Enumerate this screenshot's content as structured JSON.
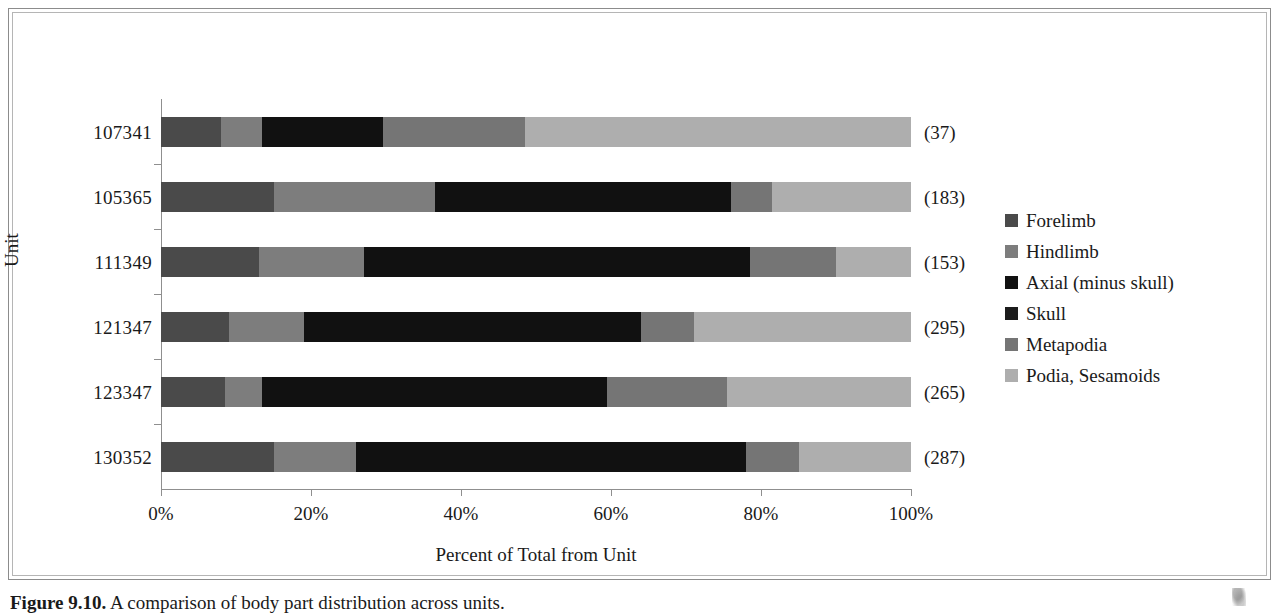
{
  "figure": {
    "caption_label": "Figure 9.10.",
    "caption_text": "A comparison of body part distribution across units."
  },
  "chart_data": {
    "type": "bar",
    "orientation": "horizontal",
    "stacked": true,
    "normalized_percent": true,
    "title": "",
    "xlabel": "Percent of Total from Unit",
    "ylabel": "Unit",
    "xlim": [
      0,
      100
    ],
    "xticks": [
      0,
      20,
      40,
      60,
      80,
      100
    ],
    "xtick_labels": [
      "0%",
      "20%",
      "40%",
      "60%",
      "80%",
      "100%"
    ],
    "grid": false,
    "legend_position": "right",
    "categories": [
      "107341",
      "105365",
      "111349",
      "121347",
      "123347",
      "130352"
    ],
    "category_totals": [
      "(37)",
      "(183)",
      "(153)",
      "(295)",
      "(265)",
      "(287)"
    ],
    "series": [
      {
        "name": "Forelimb",
        "color": "#4a4a4a",
        "values": [
          8.0,
          15.0,
          13.0,
          9.0,
          8.5,
          15.0
        ]
      },
      {
        "name": "Hindlimb",
        "color": "#7d7d7d",
        "values": [
          5.5,
          21.5,
          14.0,
          10.0,
          5.0,
          11.0
        ]
      },
      {
        "name": "Axial (minus skull)",
        "color": "#111111",
        "values": [
          16.1,
          39.5,
          51.5,
          45.0,
          46.0,
          52.0
        ]
      },
      {
        "name": "Skull",
        "color": "#1c1c1c",
        "values": [
          0.0,
          0.0,
          0.0,
          0.0,
          0.0,
          0.0
        ]
      },
      {
        "name": "Metapodia",
        "color": "#757575",
        "values": [
          18.9,
          5.5,
          11.5,
          7.0,
          16.0,
          7.0
        ]
      },
      {
        "name": "Podia, Sesamoids",
        "color": "#aeaeae",
        "values": [
          51.5,
          18.5,
          10.0,
          29.0,
          24.5,
          15.0
        ]
      }
    ]
  }
}
